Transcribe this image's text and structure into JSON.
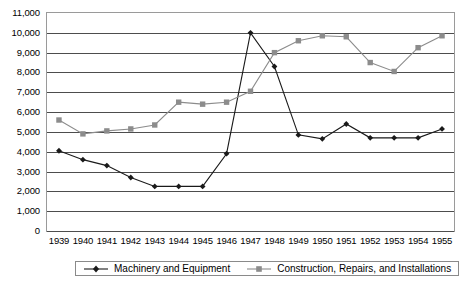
{
  "chart_data": {
    "type": "line",
    "title": "",
    "subtitle": "",
    "xlabel": "",
    "ylabel": "",
    "x": [
      1939,
      1940,
      1941,
      1942,
      1943,
      1944,
      1945,
      1946,
      1947,
      1948,
      1949,
      1950,
      1951,
      1952,
      1953,
      1954,
      1955
    ],
    "categories": [
      "1939",
      "1940",
      "1941",
      "1942",
      "1943",
      "1944",
      "1945",
      "1946",
      "1947",
      "1948",
      "1949",
      "1950",
      "1951",
      "1952",
      "1953",
      "1954",
      "1955"
    ],
    "ylim": [
      0,
      11000
    ],
    "yticks": [
      0,
      1000,
      2000,
      3000,
      4000,
      5000,
      6000,
      7000,
      8000,
      9000,
      10000,
      11000
    ],
    "ytick_labels": [
      "0",
      "1,000",
      "2,000",
      "3,000",
      "4,000",
      "5,000",
      "6,000",
      "7,000",
      "8,000",
      "9,000",
      "10,000",
      "11,000"
    ],
    "grid": "horizontal",
    "legend_position": "bottom",
    "series": [
      {
        "name": "Machinery and Equipment",
        "marker": "diamond",
        "color": "#1a1a1a",
        "values": [
          4050,
          3600,
          3300,
          2700,
          2250,
          2250,
          2250,
          3900,
          10000,
          8300,
          4850,
          4650,
          5400,
          4700,
          4700,
          4700,
          5150
        ]
      },
      {
        "name": "Construction, Repairs, and Installations",
        "marker": "square",
        "color": "#8c8c8c",
        "values": [
          5600,
          4900,
          5050,
          5150,
          5350,
          6500,
          6400,
          6500,
          7050,
          9000,
          9600,
          9850,
          9800,
          8500,
          8050,
          9250,
          9850
        ]
      }
    ]
  },
  "legend": {
    "items": [
      {
        "label": "Machinery and Equipment"
      },
      {
        "label": "Construction, Repairs, and Installations"
      }
    ]
  },
  "colors": {
    "series_machinery": "#1a1a1a",
    "series_construction": "#8c8c8c",
    "gridline": "#4d4d4d",
    "frame": "#9a9a9a",
    "background": "#ffffff"
  }
}
